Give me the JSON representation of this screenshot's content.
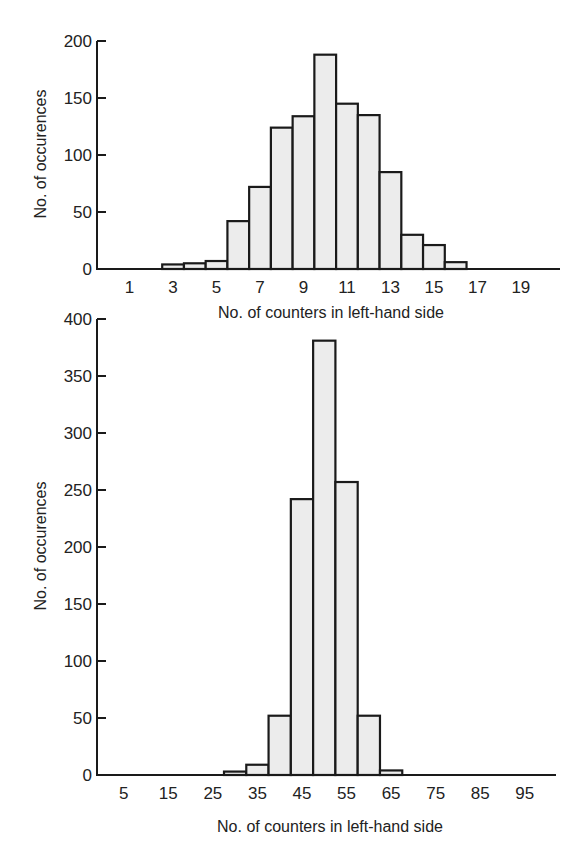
{
  "chart_data": [
    {
      "type": "bar",
      "title": "",
      "xlabel": "No. of counters in left-hand side",
      "ylabel": "No. of occurences",
      "x_tick_labels": [
        "1",
        "3",
        "5",
        "7",
        "9",
        "11",
        "13",
        "15",
        "17",
        "19"
      ],
      "y_tick_labels": [
        "0",
        "50",
        "100",
        "150",
        "200"
      ],
      "ylim": [
        0,
        200
      ],
      "xlim": [
        -0.5,
        20.8
      ],
      "bin_width": 1,
      "categories": [
        3,
        4,
        5,
        6,
        7,
        8,
        9,
        10,
        11,
        12,
        13,
        14,
        15,
        16
      ],
      "values": [
        4,
        5,
        7,
        42,
        72,
        124,
        134,
        188,
        145,
        135,
        85,
        30,
        21,
        6
      ],
      "grid": false,
      "legend": null
    },
    {
      "type": "bar",
      "title": "",
      "xlabel": "No. of counters in left-hand side",
      "ylabel": "No. of occurences",
      "x_tick_labels": [
        "5",
        "15",
        "25",
        "35",
        "45",
        "55",
        "65",
        "75",
        "85",
        "95"
      ],
      "y_tick_labels": [
        "0",
        "50",
        "100",
        "150",
        "200",
        "250",
        "300",
        "350",
        "400"
      ],
      "ylim": [
        0,
        400
      ],
      "xlim": [
        -1,
        102
      ],
      "bin_width": 5,
      "categories": [
        30,
        35,
        40,
        45,
        50,
        55,
        60,
        65
      ],
      "values": [
        3,
        9,
        52,
        242,
        381,
        257,
        52,
        4
      ],
      "grid": false,
      "legend": null
    }
  ]
}
